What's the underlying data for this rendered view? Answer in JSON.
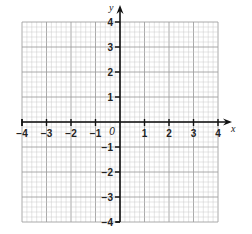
{
  "chart_data": {
    "type": "scatter",
    "title": "",
    "subtitle": "",
    "xlabel": "x",
    "ylabel": "y",
    "xlim": [
      -4,
      4
    ],
    "ylim": [
      -4,
      4
    ],
    "grid": true,
    "grid_minor_per_unit": 5,
    "origin_label": "0",
    "x_ticks": [
      -4,
      -3,
      -2,
      -1,
      1,
      2,
      3,
      4
    ],
    "x_tick_labels": [
      "−4",
      "−3",
      "−2",
      "−1",
      "1",
      "2",
      "3",
      "4"
    ],
    "y_ticks": [
      -4,
      -3,
      -2,
      -1,
      1,
      2,
      3,
      4
    ],
    "y_tick_labels": [
      "−4",
      "−3",
      "−2",
      "−1",
      "1",
      "2",
      "3",
      "4"
    ],
    "series": [],
    "legend": null
  },
  "colors": {
    "minor_grid": "#c8c8c8",
    "major_grid": "#a0a0a0",
    "axis": "#111111",
    "text": "#222222"
  },
  "layout": {
    "grid_left": 22,
    "grid_top": 22,
    "grid_right": 218,
    "grid_bottom": 222,
    "origin_x": 120,
    "origin_y": 122,
    "unit_x": 24.5,
    "unit_y": 25
  }
}
